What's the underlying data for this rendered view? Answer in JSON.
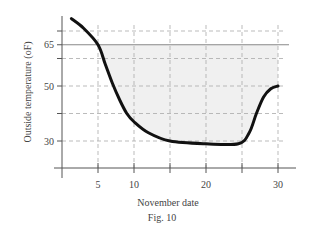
{
  "chart_data": {
    "type": "line",
    "title": "",
    "caption": "Fig. 10",
    "xlabel": "November date",
    "ylabel": "Outside temperature  (oF)",
    "x_ticks": [
      5,
      10,
      20,
      30
    ],
    "x_tick_minor": [
      15,
      25
    ],
    "y_ticks": [
      30,
      50,
      65
    ],
    "y_grid": [
      30,
      40,
      50,
      60,
      65,
      70
    ],
    "xlim": [
      0,
      32
    ],
    "ylim": [
      20,
      76
    ],
    "grid": true,
    "reference_line": {
      "y": 65,
      "label": "65",
      "style": "solid"
    },
    "shaded_region": {
      "description": "area between curve and 65 line",
      "x_range": [
        5,
        30
      ],
      "color": "#f0f0f0"
    },
    "series": [
      {
        "name": "Outside temperature",
        "color": "#111111",
        "x": [
          1.3,
          3,
          5,
          6,
          7,
          8,
          9,
          10,
          12,
          15,
          20,
          24.5,
          26,
          27,
          28,
          29,
          30
        ],
        "y": [
          74.5,
          71,
          65,
          58,
          51,
          45,
          40,
          37,
          33,
          30,
          29,
          29,
          33,
          40,
          46,
          49,
          50
        ]
      }
    ]
  }
}
